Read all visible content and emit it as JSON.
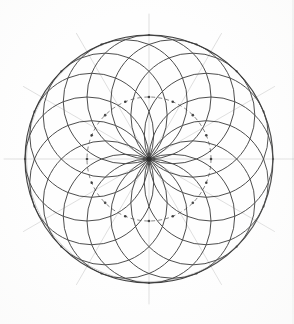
{
  "figure": {
    "kind": "compass-and-straightedge geometric construction",
    "medium": "pencil / ink line drawing on paper",
    "background_color": "#fefefe"
  },
  "canvas": {
    "width": 294,
    "height": 324
  },
  "chart_data": {
    "type": "scatter",
    "subtitle": "",
    "xlabel": "",
    "ylabel": "",
    "grid": false,
    "legend": "none",
    "xlim": [
      0,
      294
    ],
    "ylim": [
      0,
      324
    ],
    "center": {
      "x": 149,
      "y": 159
    },
    "outer_circle": {
      "label": "bounding circle",
      "cx": 149,
      "cy": 159,
      "r": 124,
      "stroke": "#3a3a3a",
      "stroke_width": 1.15,
      "dash": "none"
    },
    "guide_circle": {
      "label": "locus of petal-circle centers",
      "cx": 149,
      "cy": 159,
      "r": 62,
      "stroke": "#4a4a4a",
      "stroke_width": 0.85,
      "dash": "4 3"
    },
    "petal_circles": {
      "label": "equal circles through the center",
      "count": 16,
      "radius": 62,
      "center_radius": 62,
      "start_angle_deg": -90,
      "angle_step_deg": 22.5,
      "stroke": "#3f3f3f",
      "stroke_width": 1.0,
      "centers_deg": [
        -90,
        -67.5,
        -45,
        -22.5,
        0,
        22.5,
        45,
        67.5,
        90,
        112.5,
        135,
        157.5,
        180,
        202.5,
        225,
        247.5
      ]
    },
    "radial_lines": {
      "label": "faint construction radii",
      "count": 12,
      "inner_radius": 0,
      "outer_radius": 145,
      "start_angle_deg": 0,
      "angle_step_deg": 30,
      "stroke": "#c9c9c9",
      "stroke_width": 0.7,
      "angles_deg": [
        0,
        30,
        60,
        90,
        120,
        150,
        180,
        210,
        240,
        270,
        300,
        330
      ]
    },
    "center_marks": {
      "label": "pencil dots at petal-circle centers",
      "count": 16,
      "radius_px": 1.3,
      "fill": "#2b2b2b"
    },
    "outer_intersection_marks": {
      "label": "marks where petal circles meet the bounding circle",
      "count": 16,
      "radius_px": 1.1,
      "fill": "#333333"
    },
    "values": [],
    "categories": []
  },
  "colors": {
    "ink_dark": "#333333",
    "ink_mid": "#4a4a4a",
    "ink_light": "#c9c9c9",
    "paper": "#fefefe",
    "mark": "#2b2b2b"
  }
}
